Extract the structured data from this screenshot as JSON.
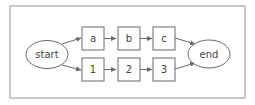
{
  "diagram": {
    "type": "flowchart",
    "nodes": [
      {
        "id": "start",
        "label": "start",
        "shape": "ellipse"
      },
      {
        "id": "a",
        "label": "a",
        "shape": "box"
      },
      {
        "id": "b",
        "label": "b",
        "shape": "box"
      },
      {
        "id": "c",
        "label": "c",
        "shape": "box"
      },
      {
        "id": "n1",
        "label": "1",
        "shape": "box"
      },
      {
        "id": "n2",
        "label": "2",
        "shape": "box"
      },
      {
        "id": "n3",
        "label": "3",
        "shape": "box"
      },
      {
        "id": "end",
        "label": "end",
        "shape": "ellipse"
      }
    ],
    "edges": [
      {
        "from": "start",
        "to": "a"
      },
      {
        "from": "a",
        "to": "b"
      },
      {
        "from": "b",
        "to": "c"
      },
      {
        "from": "c",
        "to": "end"
      },
      {
        "from": "start",
        "to": "n1"
      },
      {
        "from": "n1",
        "to": "n2"
      },
      {
        "from": "n2",
        "to": "n3"
      },
      {
        "from": "n3",
        "to": "end"
      }
    ]
  },
  "labels": {
    "start": "start",
    "a": "a",
    "b": "b",
    "c": "c",
    "n1": "1",
    "n2": "2",
    "n3": "3",
    "end": "end"
  }
}
